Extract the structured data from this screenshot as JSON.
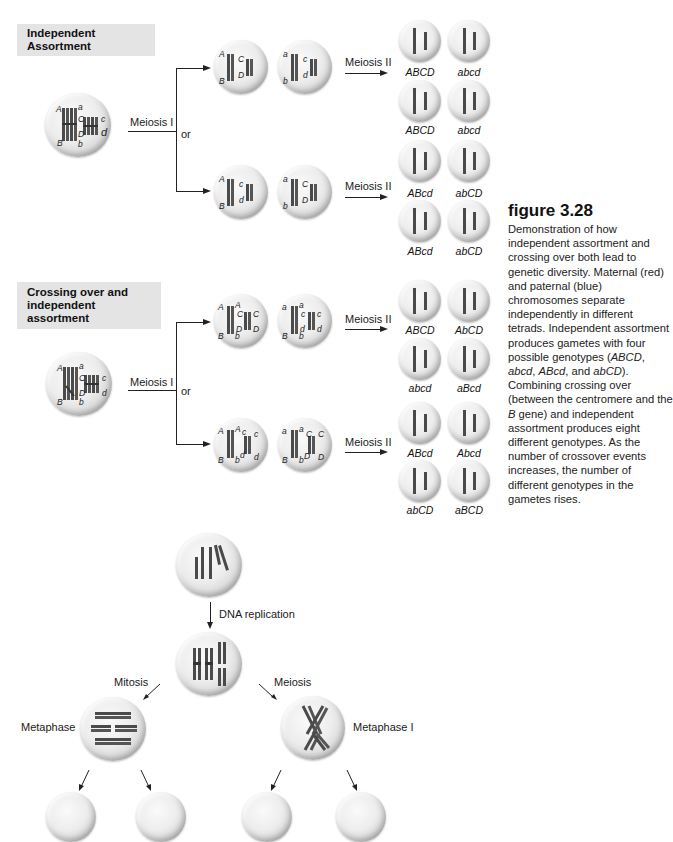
{
  "figure": {
    "number": "figure 3.28",
    "caption_parts": [
      {
        "text": "Demonstration of how independent assortment and crossing over both lead to genetic diversity. Maternal (red) and paternal (blue) chromosomes separate independently in different tetrads. Independent assortment produces gametes with four possible genotypes (",
        "italic": false
      },
      {
        "text": "ABCD",
        "italic": true
      },
      {
        "text": ", ",
        "italic": false
      },
      {
        "text": "abcd",
        "italic": true
      },
      {
        "text": ", ",
        "italic": false
      },
      {
        "text": "ABcd",
        "italic": true
      },
      {
        "text": ", and ",
        "italic": false
      },
      {
        "text": "abCD",
        "italic": true
      },
      {
        "text": "). Combining crossing over (between the centromere and the ",
        "italic": false
      },
      {
        "text": "B",
        "italic": true
      },
      {
        "text": " gene) and independent assortment produces eight different genotypes. As the number of crossover events increases, the number of different genotypes in the gametes rises.",
        "italic": false
      }
    ]
  },
  "panels": {
    "independent": {
      "header": "Independent Assortment",
      "parent_alleles": {
        "left_top": "A",
        "left_bottom": "B",
        "mid_top": "a",
        "mid_bottom": "b",
        "c_left": "C",
        "c_right": "c",
        "d_left": "D",
        "d_right": "d"
      },
      "step1": "Meiosis I",
      "or": "or",
      "step2": "Meiosis II",
      "routes": [
        {
          "daughters": [
            {
              "top": "A",
              "bottom": "B",
              "c": "C",
              "d": "D"
            },
            {
              "top": "a",
              "bottom": "b",
              "c": "c",
              "d": "d"
            }
          ],
          "gametes": [
            "ABCD",
            "abcd",
            "ABCD",
            "abcd"
          ]
        },
        {
          "daughters": [
            {
              "top": "A",
              "bottom": "B",
              "c": "c",
              "d": "d"
            },
            {
              "top": "a",
              "bottom": "b",
              "c": "C",
              "d": "D"
            }
          ],
          "gametes": [
            "ABcd",
            "abCD",
            "ABcd",
            "abCD"
          ]
        }
      ]
    },
    "crossing": {
      "header_line1": "Crossing over and",
      "header_line2": "independent assortment",
      "step1": "Meiosis I",
      "or": "or",
      "step2": "Meiosis II",
      "routes": [
        {
          "daughters": [
            {
              "tl": "A",
              "tr": "A",
              "bl": "B",
              "br": "b",
              "c1": "C",
              "c2": "C",
              "d1": "D",
              "d2": "D"
            },
            {
              "tl": "a",
              "tr": "a",
              "bl": "B",
              "br": "b",
              "c1": "c",
              "c2": "c",
              "d1": "d",
              "d2": "d"
            }
          ],
          "gametes": [
            "ABCD",
            "AbCD",
            "abcd",
            "aBcd"
          ]
        },
        {
          "daughters": [
            {
              "tl": "A",
              "tr": "A",
              "bl": "B",
              "br": "b",
              "c1": "c",
              "c2": "c",
              "d1": "d",
              "d2": "d"
            },
            {
              "tl": "a",
              "tr": "a",
              "bl": "B",
              "br": "b",
              "c1": "C",
              "c2": "C",
              "d1": "D",
              "d2": "D"
            }
          ],
          "gametes": [
            "ABcd",
            "Abcd",
            "abCD",
            "aBCD"
          ]
        }
      ]
    },
    "comparison": {
      "replication": "DNA replication",
      "mitosis": "Mitosis",
      "meiosis": "Meiosis",
      "metaphase": "Metaphase",
      "metaphase_I": "Metaphase I"
    }
  },
  "colors": {
    "header_bg": "#e4e4e4",
    "chromosome": "#4a4a4a",
    "cell_edge": "#a8a8a8"
  }
}
